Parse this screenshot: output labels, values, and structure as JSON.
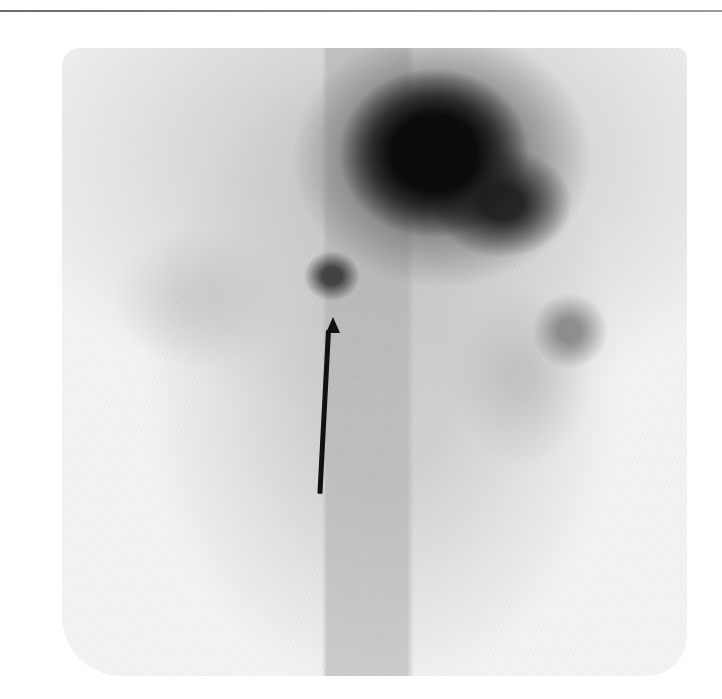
{
  "image": {
    "type": "nuclear-medicine-scintigraphy",
    "description": "Grayscale planar scan with dark activity at upper center, small focal uptake marked by arrow, faint uptake on right side",
    "colors": {
      "background": "#ffffff",
      "hot_region": "#0a0a0a",
      "soft_tissue": "#c8c8c8",
      "arrow": "#111111",
      "top_rule": "#7a7a7a"
    }
  },
  "annotations": [
    {
      "kind": "arrow",
      "direction": "up",
      "tip": [
        333,
        318
      ],
      "tail": [
        324,
        493
      ],
      "points_to": "focal uptake"
    }
  ],
  "regions": [
    {
      "name": "large-uptake",
      "center": [
        434,
        153
      ]
    },
    {
      "name": "focal-uptake",
      "center": [
        332,
        276
      ]
    },
    {
      "name": "right-uptake",
      "center": [
        570,
        331
      ]
    }
  ]
}
